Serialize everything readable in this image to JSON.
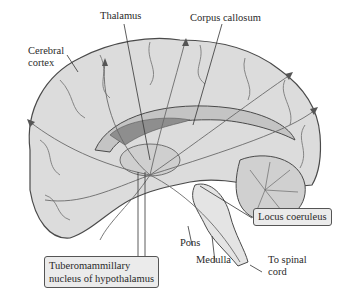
{
  "diagram": {
    "labels": {
      "thalamus": "Thalamus",
      "corpus_callosum": "Corpus callosum",
      "cerebral_cortex_line1": "Cerebral",
      "cerebral_cortex_line2": "cortex",
      "locus_coeruleus": "Locus coeruleus",
      "pons": "Pons",
      "medulla": "Medulla",
      "spinal_line1": "To spinal",
      "spinal_line2": "cord",
      "tmn_line1": "Tuberomammillary",
      "tmn_line2": "nucleus of hypothalamus"
    },
    "colors": {
      "brain_fill": "#dcdcdc",
      "brain_shadow": "#a8a8a8",
      "outline": "#4a4a4a",
      "pathway": "#6a6a6a",
      "box_fill": "#ebebeb"
    }
  }
}
